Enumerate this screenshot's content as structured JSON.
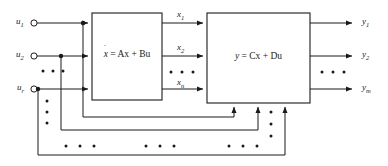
{
  "diagram": {
    "type": "state-space-block-diagram",
    "background_color": "#ffffff",
    "line_color": "#1a1a1a",
    "inputs": [
      {
        "label": "u",
        "subscript": "1",
        "y": 23
      },
      {
        "label": "u",
        "subscript": "2",
        "y": 56
      },
      {
        "label": "u",
        "subscript": "r",
        "y": 89
      }
    ],
    "states": [
      {
        "label": "x",
        "subscript": "1",
        "y": 23
      },
      {
        "label": "x",
        "subscript": "2",
        "y": 56
      },
      {
        "label": "x",
        "subscript": "n",
        "y": 89
      }
    ],
    "outputs": [
      {
        "label": "y",
        "subscript": "1",
        "y": 23
      },
      {
        "label": "y",
        "subscript": "2",
        "y": 56
      },
      {
        "label": "y",
        "subscript": "m",
        "y": 89
      }
    ],
    "blocks": [
      {
        "id": "state-equation",
        "equation": "ẋ = Ax + Bu",
        "eq_lhs": "x",
        "eq_rhs": "= Ax + Bu",
        "x": 92,
        "y": 13,
        "width": 70,
        "height": 87
      },
      {
        "id": "output-equation",
        "equation": "y = Cx + Du",
        "eq_lhs": "y",
        "eq_rhs": "= Cx + Du",
        "x": 207,
        "y": 13,
        "width": 103,
        "height": 90
      }
    ],
    "ellipses": {
      "input_horizontal_dots": 3,
      "state_horizontal_dots": 3,
      "output_horizontal_dots": 3,
      "feedforward_vertical_dots": 3,
      "bottom_rail_dot_groups": 3
    },
    "feedforward_paths": [
      {
        "from_input": "u1",
        "tap_x": 83,
        "rail_y": 117,
        "to_x": 234
      },
      {
        "from_input": "u2",
        "tap_x": 61,
        "rail_y": 130,
        "to_x": 258
      },
      {
        "from_input": "ur",
        "tap_x": 38,
        "rail_y": 155,
        "to_x": 285
      }
    ]
  }
}
